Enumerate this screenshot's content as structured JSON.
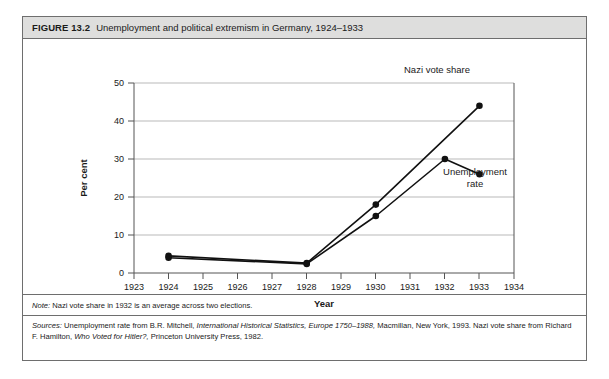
{
  "figure": {
    "number": "FIGURE 13.2",
    "title": "Unemployment and political extremism in Germany, 1924–1933",
    "note_lead": "Note:",
    "note_text": " Nazi vote share in 1932 is an average across two elections.",
    "sources_lead": "Sources:",
    "sources_part1": " Unemployment rate from B.R. Mitchell, ",
    "sources_cite1": "International Historical Statistics, Europe 1750–1988,",
    "sources_part2": " Macmillan, New York, 1993. Nazi vote share from Richard F. Hamilton, ",
    "sources_cite2": "Who Voted for Hitler?,",
    "sources_part3": " Princeton University Press, 1982."
  },
  "chart_data": {
    "type": "line",
    "title": "Unemployment and political extremism in Germany, 1924–1933",
    "xlabel": "Year",
    "ylabel": "Per cent",
    "xlim": [
      1923,
      1934
    ],
    "ylim": [
      0,
      50
    ],
    "xticks": [
      1923,
      1924,
      1925,
      1926,
      1927,
      1928,
      1929,
      1930,
      1931,
      1932,
      1933,
      1934
    ],
    "yticks": [
      0,
      10,
      20,
      30,
      40,
      50
    ],
    "grid": "horizontal",
    "legend": "inline-annotations",
    "series": [
      {
        "name": "Nazi vote share",
        "x": [
          1924,
          1928,
          1930,
          1933
        ],
        "values": [
          4.5,
          2.6,
          18.0,
          44.0
        ],
        "label": "Nazi vote share"
      },
      {
        "name": "Unemployment rate",
        "x": [
          1924,
          1928,
          1930,
          1932,
          1933
        ],
        "values": [
          4.0,
          2.4,
          15.0,
          30.0,
          26.0
        ],
        "label_line1": "Unemployment",
        "label_line2": "rate"
      }
    ]
  },
  "axis": {
    "x_tick_labels": [
      "1923",
      "1924",
      "1925",
      "1926",
      "1927",
      "1928",
      "1929",
      "1930",
      "1931",
      "1932",
      "1933",
      "1934"
    ],
    "y_tick_labels": [
      "0",
      "10",
      "20",
      "30",
      "40",
      "50"
    ],
    "x_title": "Year",
    "y_title": "Per cent"
  },
  "annotations": {
    "nazi_label": "Nazi vote share",
    "unemp_label_line1": "Unemployment",
    "unemp_label_line2": "rate"
  }
}
